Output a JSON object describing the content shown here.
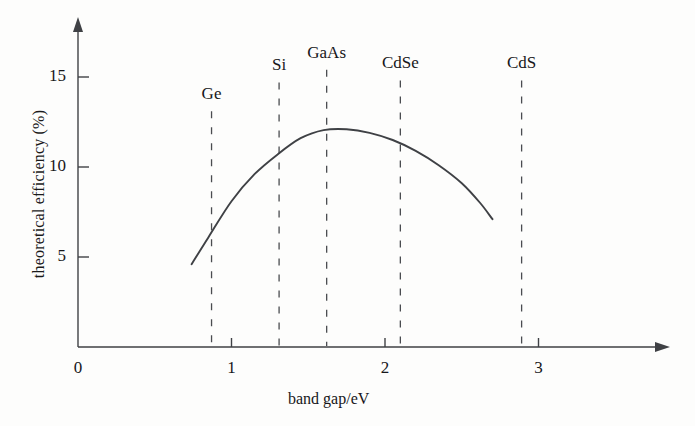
{
  "chart_data": {
    "type": "line",
    "title": "",
    "xlabel": "band gap/eV",
    "ylabel": "theoretical efficiency (%)",
    "xlim": [
      0,
      3.15
    ],
    "ylim": [
      0,
      16.8
    ],
    "grid": false,
    "legend": "none",
    "xticks": [
      {
        "value": 0,
        "label": "0"
      },
      {
        "value": 1,
        "label": "1"
      },
      {
        "value": 2,
        "label": "2"
      },
      {
        "value": 3,
        "label": "3"
      }
    ],
    "yticks": [
      {
        "value": 5,
        "label": "5"
      },
      {
        "value": 10,
        "label": "10"
      },
      {
        "value": 15,
        "label": "15"
      }
    ],
    "series": [
      {
        "name": "theoretical efficiency",
        "color": "#3f4145",
        "x": [
          0.74,
          0.85,
          1.0,
          1.15,
          1.3,
          1.45,
          1.6,
          1.75,
          1.9,
          2.05,
          2.2,
          2.35,
          2.5,
          2.62,
          2.7
        ],
        "y": [
          4.6,
          6.1,
          8.1,
          9.6,
          10.7,
          11.6,
          12.05,
          12.1,
          11.9,
          11.5,
          10.9,
          10.1,
          9.1,
          8.0,
          7.1
        ]
      }
    ],
    "annotations": [
      {
        "label": "Ge",
        "x": 0.87,
        "label_y": 14.0,
        "line_top_y": 13.1,
        "line_bottom_y": 0.05
      },
      {
        "label": "Si",
        "x": 1.31,
        "label_y": 15.6,
        "line_top_y": 14.7,
        "line_bottom_y": 0.05
      },
      {
        "label": "GaAs",
        "x": 1.62,
        "label_y": 16.3,
        "line_top_y": 15.4,
        "line_bottom_y": 0.05
      },
      {
        "label": "CdSe",
        "x": 2.1,
        "label_y": 15.7,
        "line_top_y": 14.8,
        "line_bottom_y": 0.05
      },
      {
        "label": "CdS",
        "x": 2.89,
        "label_y": 15.7,
        "line_top_y": 14.8,
        "line_bottom_y": 0.05
      }
    ]
  },
  "axes": {
    "x_axis_name": "band gap axis",
    "y_axis_name": "theoretical efficiency axis"
  }
}
